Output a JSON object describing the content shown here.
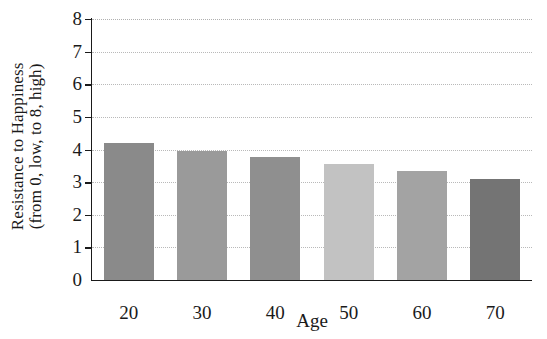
{
  "chart_data": {
    "type": "bar",
    "title": "",
    "subtitle": "",
    "xlabel": "Age",
    "ylabel_line1": "Resistance to Happiness",
    "ylabel_line2": "(from 0, low, to 8, high)",
    "categories": [
      "20",
      "30",
      "40",
      "50",
      "60",
      "70"
    ],
    "values": [
      4.2,
      3.95,
      3.77,
      3.55,
      3.33,
      3.1
    ],
    "ylim": [
      0,
      8
    ],
    "ytick_labels": [
      "0",
      "1",
      "2",
      "3",
      "4",
      "5",
      "6",
      "7",
      "8"
    ],
    "ytick_values": [
      0,
      1,
      2,
      3,
      4,
      5,
      6,
      7,
      8
    ],
    "grid": "horizontal-dotted",
    "legend": "none",
    "bar_colors": [
      "#8a8a8a",
      "#9a9a9a",
      "#8f8f8f",
      "#c2c2c2",
      "#a3a3a3",
      "#747474"
    ],
    "axis_color": "#1a1a1a",
    "grid_color": "#b9b9b9",
    "background_color": "#ffffff"
  }
}
